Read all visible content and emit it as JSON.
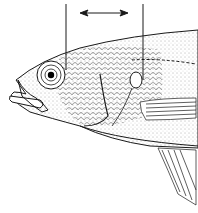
{
  "figure": {
    "measurement": {
      "type": "horizontal distance indicator",
      "arrow": "double-headed",
      "left_reference_line": "vertical line through eye",
      "right_reference_line": "vertical line through opercular spot"
    },
    "colors": {
      "line": "#1a1a1a",
      "background": "#ffffff",
      "stipple": "#555555"
    }
  }
}
